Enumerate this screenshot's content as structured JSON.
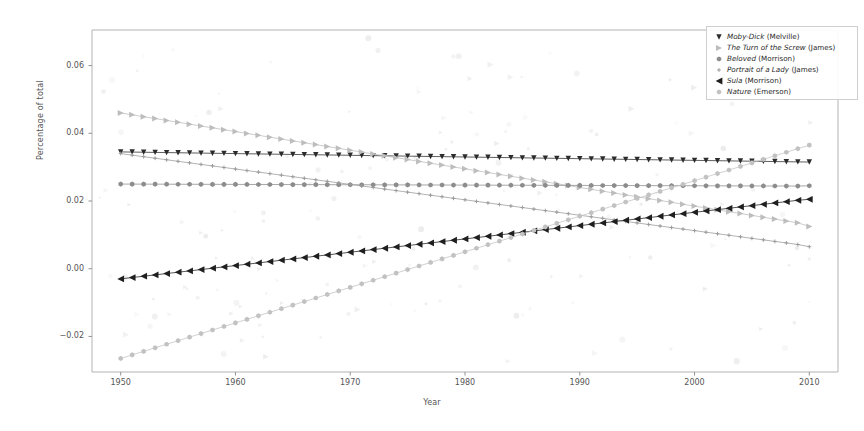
{
  "figure": {
    "width": 864,
    "height": 431,
    "background": "#ffffff"
  },
  "axes": {
    "left_px": 92,
    "right_px": 838,
    "top_px": 30,
    "bottom_px": 372,
    "spine_color": "#aaaaaa",
    "tick_color": "#888888"
  },
  "chart_data": {
    "type": "line",
    "title": "",
    "xlabel": "Year",
    "ylabel": "Percentage of total",
    "xlim": [
      1947.5,
      2012.5
    ],
    "ylim": [
      -0.0305,
      0.0705
    ],
    "xticks": [
      1950,
      1960,
      1970,
      1980,
      1990,
      2000,
      2010
    ],
    "xticklabels": [
      "1950",
      "1960",
      "1970",
      "1980",
      "1990",
      "2000",
      "2010"
    ],
    "yticks": [
      -0.02,
      0.0,
      0.02,
      0.04,
      0.06
    ],
    "yticklabels": [
      "-0.02",
      "0.00",
      "0.02",
      "0.04",
      "0.06"
    ],
    "grid": false,
    "legend_position": "upper right",
    "x": [
      1950,
      1951,
      1952,
      1953,
      1954,
      1955,
      1956,
      1957,
      1958,
      1959,
      1960,
      1961,
      1962,
      1963,
      1964,
      1965,
      1966,
      1967,
      1968,
      1969,
      1970,
      1971,
      1972,
      1973,
      1974,
      1975,
      1976,
      1977,
      1978,
      1979,
      1980,
      1981,
      1982,
      1983,
      1984,
      1985,
      1986,
      1987,
      1988,
      1989,
      1990,
      1991,
      1992,
      1993,
      1994,
      1995,
      1996,
      1997,
      1998,
      1999,
      2000,
      2001,
      2002,
      2003,
      2004,
      2005,
      2006,
      2007,
      2008,
      2009,
      2010
    ],
    "series": [
      {
        "name": "Moby-Dick (Melville)",
        "marker": "caret-down",
        "color": "#2b2b2b",
        "values": [
          0.0345,
          0.03445,
          0.0344,
          0.03435,
          0.0343,
          0.03425,
          0.0342,
          0.03415,
          0.0341,
          0.03405,
          0.034,
          0.03395,
          0.0339,
          0.03385,
          0.0338,
          0.03375,
          0.0337,
          0.03365,
          0.0336,
          0.03355,
          0.0335,
          0.03345,
          0.0334,
          0.03335,
          0.0333,
          0.03325,
          0.0332,
          0.03315,
          0.0331,
          0.03305,
          0.033,
          0.03295,
          0.0329,
          0.03285,
          0.0328,
          0.03275,
          0.0327,
          0.03265,
          0.0326,
          0.03255,
          0.0325,
          0.03245,
          0.0324,
          0.03235,
          0.0323,
          0.03225,
          0.0322,
          0.03215,
          0.0321,
          0.03205,
          0.032,
          0.03195,
          0.0319,
          0.03185,
          0.0318,
          0.03175,
          0.0317,
          0.03165,
          0.0316,
          0.03155,
          0.0315
        ]
      },
      {
        "name": "The Turn of the Screw (James)",
        "marker": "triangle-right",
        "color": "#bdbdbd",
        "values": [
          0.046,
          0.04545,
          0.0449,
          0.04435,
          0.0438,
          0.04325,
          0.0427,
          0.04215,
          0.0416,
          0.04105,
          0.0405,
          0.03995,
          0.0394,
          0.03885,
          0.0383,
          0.03775,
          0.0372,
          0.03665,
          0.0361,
          0.03555,
          0.035,
          0.03445,
          0.0339,
          0.03335,
          0.0328,
          0.03225,
          0.0317,
          0.03115,
          0.0306,
          0.03005,
          0.0295,
          0.02895,
          0.0284,
          0.02785,
          0.0273,
          0.02675,
          0.0262,
          0.02565,
          0.0251,
          0.02455,
          0.024,
          0.02345,
          0.0229,
          0.02235,
          0.0218,
          0.02125,
          0.0207,
          0.02015,
          0.0196,
          0.01905,
          0.0185,
          0.01795,
          0.0174,
          0.01685,
          0.0163,
          0.01575,
          0.0152,
          0.01465,
          0.0141,
          0.01355,
          0.0125
        ]
      },
      {
        "name": "Beloved (Morrison)",
        "marker": "hexagon",
        "color": "#8c8c8c",
        "values": [
          0.025,
          0.02499,
          0.02498,
          0.02497,
          0.02496,
          0.02495,
          0.02494,
          0.02493,
          0.02492,
          0.02491,
          0.0249,
          0.02489,
          0.02488,
          0.02487,
          0.02486,
          0.02485,
          0.02484,
          0.02483,
          0.02482,
          0.02481,
          0.0248,
          0.02479,
          0.02478,
          0.02477,
          0.02476,
          0.02475,
          0.02474,
          0.02473,
          0.02472,
          0.02471,
          0.0247,
          0.02469,
          0.02468,
          0.02467,
          0.02466,
          0.02465,
          0.02464,
          0.02463,
          0.02462,
          0.02461,
          0.0246,
          0.02459,
          0.02458,
          0.02457,
          0.02456,
          0.02455,
          0.02454,
          0.02453,
          0.02452,
          0.02451,
          0.0245,
          0.02449,
          0.02448,
          0.02447,
          0.02446,
          0.02445,
          0.02444,
          0.02443,
          0.02442,
          0.02441,
          0.0245
        ]
      },
      {
        "name": "Portrait of a Lady (James)",
        "marker": "plus",
        "color": "#9a9a9a",
        "values": [
          0.034,
          0.03354,
          0.03309,
          0.03263,
          0.03218,
          0.03172,
          0.03127,
          0.03081,
          0.03036,
          0.0299,
          0.02945,
          0.02899,
          0.02854,
          0.02808,
          0.02763,
          0.02717,
          0.02672,
          0.02626,
          0.02581,
          0.02535,
          0.0249,
          0.02444,
          0.02399,
          0.02353,
          0.02308,
          0.02262,
          0.02217,
          0.02171,
          0.02126,
          0.0208,
          0.02035,
          0.01989,
          0.01944,
          0.01898,
          0.01853,
          0.01807,
          0.01762,
          0.01716,
          0.01671,
          0.01625,
          0.0158,
          0.01534,
          0.01489,
          0.01443,
          0.01398,
          0.01352,
          0.01307,
          0.01261,
          0.01216,
          0.0117,
          0.01125,
          0.01079,
          0.01034,
          0.00988,
          0.00943,
          0.00897,
          0.00852,
          0.00806,
          0.00761,
          0.00715,
          0.0065
        ]
      },
      {
        "name": "Sula (Morrison)",
        "marker": "triangle-left",
        "color": "#1f1f1f",
        "values": [
          -0.003,
          -0.00261,
          -0.00221,
          -0.00182,
          -0.00143,
          -0.00103,
          -0.00064,
          -0.00025,
          0.00015,
          0.00054,
          0.00093,
          0.00133,
          0.00172,
          0.00211,
          0.00251,
          0.0029,
          0.00329,
          0.00369,
          0.00408,
          0.00447,
          0.00487,
          0.00526,
          0.00565,
          0.00605,
          0.00644,
          0.00683,
          0.00723,
          0.00762,
          0.00801,
          0.00841,
          0.0088,
          0.00919,
          0.00959,
          0.00998,
          0.01037,
          0.01077,
          0.01116,
          0.01155,
          0.01195,
          0.01234,
          0.01273,
          0.01313,
          0.01352,
          0.01391,
          0.01431,
          0.0147,
          0.01509,
          0.01549,
          0.01588,
          0.01627,
          0.01667,
          0.01706,
          0.01745,
          0.01785,
          0.01824,
          0.01863,
          0.01903,
          0.01942,
          0.01981,
          0.02021,
          0.0205
        ]
      },
      {
        "name": "Nature (Emerson)",
        "marker": "hexagon",
        "color": "#c2c2c2",
        "values": [
          -0.0265,
          -0.02545,
          -0.0244,
          -0.02335,
          -0.0223,
          -0.02125,
          -0.0202,
          -0.01915,
          -0.0181,
          -0.01705,
          -0.016,
          -0.01495,
          -0.0139,
          -0.01285,
          -0.0118,
          -0.01075,
          -0.0097,
          -0.00865,
          -0.0076,
          -0.00655,
          -0.0055,
          -0.00445,
          -0.0034,
          -0.00235,
          -0.0013,
          -0.00025,
          0.0008,
          0.00185,
          0.0029,
          0.00395,
          0.005,
          0.00605,
          0.0071,
          0.00815,
          0.0092,
          0.01025,
          0.0113,
          0.01235,
          0.0134,
          0.01445,
          0.0155,
          0.01655,
          0.0176,
          0.01865,
          0.0197,
          0.02075,
          0.0218,
          0.02285,
          0.0239,
          0.02495,
          0.026,
          0.02705,
          0.0281,
          0.02915,
          0.0302,
          0.03125,
          0.0323,
          0.03335,
          0.0344,
          0.03545,
          0.0365
        ]
      }
    ],
    "scatter_noise": {
      "description": "faint light-gray scattered marker points behind the trend lines",
      "color": "#e2e2e2",
      "count": 160
    }
  },
  "legend": {
    "position": "upper right",
    "border_color": "#cfcfcf",
    "entries": [
      {
        "label": "Moby-Dick (Melville)",
        "marker": "caret-down",
        "color": "#2b2b2b"
      },
      {
        "label": "The Turn of the Screw (James)",
        "marker": "triangle-right",
        "color": "#bdbdbd"
      },
      {
        "label": "Beloved (Morrison)",
        "marker": "hexagon",
        "color": "#8c8c8c"
      },
      {
        "label": "Portrait of a Lady (James)",
        "marker": "plus",
        "color": "#9a9a9a"
      },
      {
        "label": "Sula (Morrison)",
        "marker": "triangle-left",
        "color": "#1f1f1f"
      },
      {
        "label": "Nature (Emerson)",
        "marker": "hexagon",
        "color": "#c2c2c2"
      }
    ]
  }
}
